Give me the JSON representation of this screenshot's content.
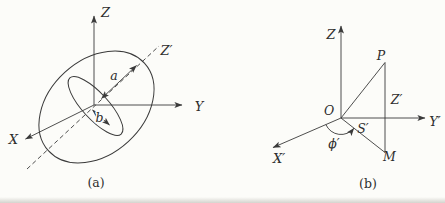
{
  "figure": {
    "colors": {
      "background": "#fcfcf9",
      "line": "#3a3a3a",
      "text": "#2d2d2d"
    },
    "panel_a": {
      "caption": "(a)",
      "axis_z": "Z",
      "axis_y": "Y",
      "axis_x": "X",
      "axis_z_prime": "Z′",
      "semi_major_label": "a",
      "semi_minor_label": "b"
    },
    "panel_b": {
      "caption": "(b)",
      "axis_z": "Z",
      "axis_y_prime": "Y′",
      "axis_x_prime": "X′",
      "origin_label": "O",
      "point_p_label": "P",
      "point_m_label": "M",
      "segment_z_prime_label": "Z′",
      "segment_s_prime_label": "S′",
      "angle_phi_prime_label": "ϕ′"
    }
  }
}
